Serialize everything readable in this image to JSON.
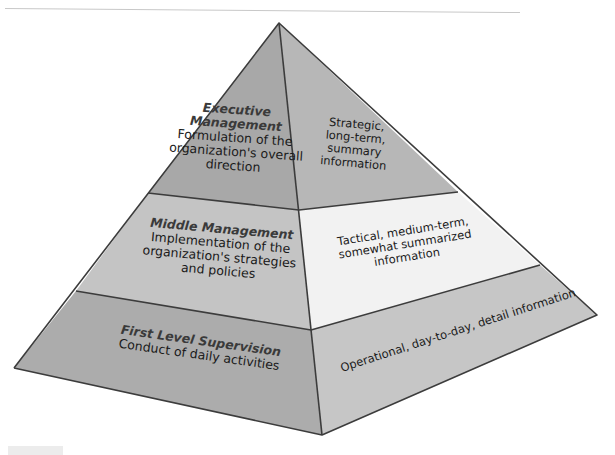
{
  "diagram": {
    "type": "pyramid",
    "colors": {
      "edge": "#3c3c3c",
      "executive_left": "#a8a8a8",
      "executive_right": "#b7b7b7",
      "middle_left": "#c4c4c4",
      "middle_right": "#f2f2f2",
      "first_left": "#acacac",
      "first_right": "#c6c6c6"
    },
    "levels": [
      {
        "name": "Executive Management",
        "title": "Executive Management",
        "title_line1": "Executive",
        "title_line2": "Management",
        "description": "Formulation of the organization's overall direction",
        "desc_line1": "Formulation of the",
        "desc_line2": "organization's overall",
        "desc_line3": "direction",
        "information": "Strategic, long-term, summary information",
        "info_line1": "Strategic,",
        "info_line2": "long-term,",
        "info_line3": "summary",
        "info_line4": "information"
      },
      {
        "name": "Middle Management",
        "title": "Middle Management",
        "description": "Implementation of the organization's strategies and policies",
        "desc_line1": "Implementation of the",
        "desc_line2": "organization's strategies",
        "desc_line3": "and policies",
        "information": "Tactical, medium-term, somewhat summarized information",
        "info_line1": "Tactical, medium-term,",
        "info_line2": "somewhat summarized",
        "info_line3": "information"
      },
      {
        "name": "First Level Supervision",
        "title": "First Level Supervision",
        "description": "Conduct of daily activities",
        "desc_line1": "Conduct of daily activities",
        "information": "Operational, day-to-day, detail information",
        "info_line1": "Operational, day-to-day, detail information"
      }
    ]
  }
}
